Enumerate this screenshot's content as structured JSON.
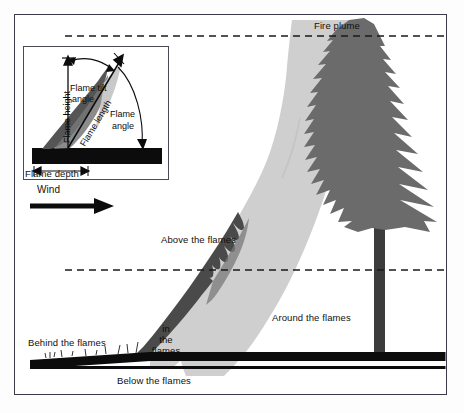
{
  "figure": {
    "type": "wildfire-fire-environment-cross-section",
    "background_color": "#ffffff",
    "frame_color": "#3a3a4a"
  },
  "colors": {
    "plume_light": "#cfcfcf",
    "plume_edge": "#c2c2c2",
    "flame_dark": "#4a4a4a",
    "flame_mid": "#6e6e6e",
    "tree_body": "#6b6b6b",
    "tree_trunk": "#3c3c3c",
    "ground_black": "#0c0c0c",
    "dash_line": "#1a1a1a",
    "text": "#111111"
  },
  "main_labels": {
    "fire_plume": "Fire plume",
    "above_the_flames": "Above the flames",
    "around_the_flames": "Around the flames",
    "behind_the_flames": "Behind the flames",
    "in_the_flames_line1": "in",
    "in_the_flames_line2": "the",
    "in_the_flames_line3": "flames",
    "below_the_flames": "Below the flames",
    "wind": "Wind"
  },
  "inset": {
    "title_none": "",
    "flame_height": "Flame height",
    "flame_tilt_angle_line1": "Flame tilt",
    "flame_tilt_angle_line2": "angle",
    "flame_length": "Flame length",
    "flame_angle_line1": "Flame",
    "flame_angle_line2": "angle",
    "flame_depth": "Flame depth"
  },
  "reference_lines": [
    {
      "name": "plume-top-dashed",
      "y": 36,
      "style": "dashed"
    },
    {
      "name": "flame-top-dashed",
      "y": 270,
      "style": "dashed"
    }
  ],
  "wind_arrow": {
    "direction": "right",
    "x_start": 30,
    "x_end": 112,
    "y": 206
  }
}
